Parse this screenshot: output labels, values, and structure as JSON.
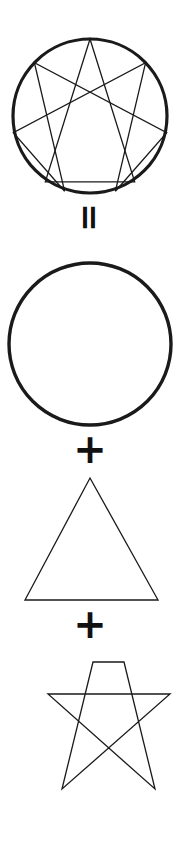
{
  "document": {
    "kind": "geometric-decomposition-diagram",
    "subject": "Enneagram figure decomposition",
    "background_color": "#ffffff",
    "stroke_color": "#1a1a1a"
  },
  "operators": [
    {
      "name": "equals",
      "symbol": "=",
      "rotated_degrees": 90
    },
    {
      "name": "plus-1",
      "symbol": "+",
      "rotated_degrees": 0
    },
    {
      "name": "plus-2",
      "symbol": "+",
      "rotated_degrees": 0
    }
  ],
  "figures": [
    {
      "id": "enneagram",
      "label": "Enneagram",
      "geometry": {
        "circle": {
          "cx": 90,
          "cy": 116,
          "r": 77,
          "stroke_width": 3.2
        },
        "inner_stroke_width": 1.3,
        "points": {
          "1": [
            145.6,
            62.7
          ],
          "2": [
            166.7,
            132.8
          ],
          "3": [
            134.7,
            181.8
          ],
          "4": [
            115.4,
            191.2
          ],
          "5": [
            64.6,
            191.2
          ],
          "6": [
            45.3,
            181.8
          ],
          "7": [
            13.3,
            132.8
          ],
          "8": [
            34.4,
            62.7
          ],
          "9": [
            90.0,
            39.0
          ]
        },
        "triangle_path": "9-3-6-9",
        "hexad_path": "1-4-2-8-5-7-1"
      }
    },
    {
      "id": "circle",
      "label": "Circle",
      "geometry": {
        "cx": 90,
        "cy": 344,
        "r": 81,
        "stroke_width": 3.4
      }
    },
    {
      "id": "triangle",
      "label": "Triangle",
      "geometry": {
        "vertices": [
          [
            90,
            478
          ],
          [
            158,
            600
          ],
          [
            25,
            600
          ]
        ],
        "stroke_width": 1.3
      }
    },
    {
      "id": "hexad",
      "label": "Hexad",
      "geometry": {
        "vertices": [
          [
            124,
            662
          ],
          [
            155,
            789
          ],
          [
            48,
            694
          ],
          [
            170,
            694
          ],
          [
            62,
            789
          ],
          [
            93,
            662
          ]
        ],
        "path_order": "1-4-2-8-5-7-1",
        "stroke_width": 1.3
      }
    }
  ]
}
